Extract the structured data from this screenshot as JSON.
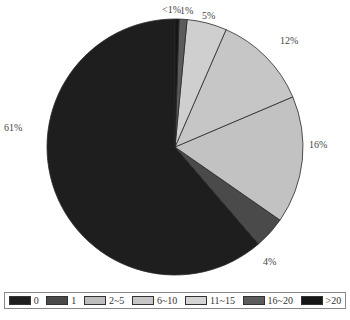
{
  "chart_data": {
    "type": "pie",
    "title": "",
    "start_angle_deg": 0,
    "direction": "counterclockwise",
    "slices": [
      {
        "category": "0",
        "value": 61,
        "label": "61%",
        "color": "#1e1e1e"
      },
      {
        "category": "1",
        "value": 4,
        "label": "4%",
        "color": "#4a4a4a"
      },
      {
        "category": "2~5",
        "value": 16,
        "label": "16%",
        "color": "#c2c2c2"
      },
      {
        "category": "6~10",
        "value": 12,
        "label": "12%",
        "color": "#c6c6c6"
      },
      {
        "category": "11~15",
        "value": 5,
        "label": "5%",
        "color": "#cfcfcf"
      },
      {
        "category": "16~20",
        "value": 1,
        "label": "1%",
        "color": "#5c5c5c"
      },
      {
        "category": ">20",
        "value": 0.5,
        "label": "<1%",
        "color": "#161616"
      }
    ],
    "legend": {
      "position": "bottom",
      "entries": [
        "0",
        "1",
        "2~5",
        "6~10",
        "11~15",
        "16~20",
        ">20"
      ]
    }
  },
  "labels": {
    "l0": "61%",
    "l1": "4%",
    "l2": "16%",
    "l3": "12%",
    "l4": "5%",
    "l5": "1%",
    "l6": "<1%"
  },
  "legend": [
    {
      "label": "0",
      "color": "#1e1e1e"
    },
    {
      "label": "1",
      "color": "#4a4a4a"
    },
    {
      "label": "2~5",
      "color": "#bdbdbd"
    },
    {
      "label": "6~10",
      "color": "#c6c6c6"
    },
    {
      "label": "11~15",
      "color": "#d4d4d4"
    },
    {
      "label": "16~20",
      "color": "#5c5c5c"
    },
    {
      "label": ">20",
      "color": "#161616"
    }
  ]
}
